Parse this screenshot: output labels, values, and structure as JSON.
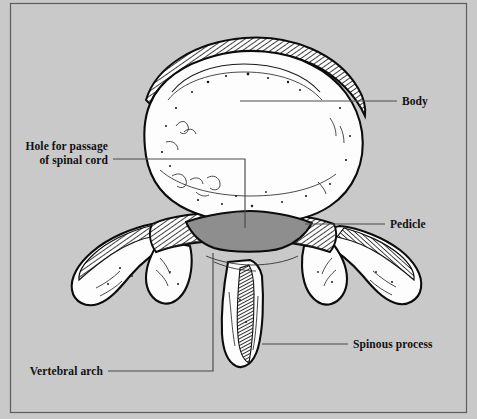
{
  "figure": {
    "background_color": "#c9c9c9",
    "frame_color": "#5c5c5c",
    "bone_fill_color": "#fdfdfd",
    "bone_outline_color": "#0c0c0c",
    "foramen_fill_color": "#8e8e8e",
    "leader_line_color": "#4a4a4a",
    "label_text_color": "#111111"
  },
  "labels": {
    "body": {
      "text": "Body",
      "position": "right"
    },
    "pedicle": {
      "text": "Pedicle",
      "position": "right"
    },
    "spinous_process": {
      "text": "Spinous process",
      "position": "right"
    },
    "hole_for_passage": {
      "line1": "Hole for passage",
      "line2": "of spinal cord",
      "position": "left"
    },
    "vertebral_arch": {
      "text": "Vertebral arch",
      "position": "left"
    }
  }
}
